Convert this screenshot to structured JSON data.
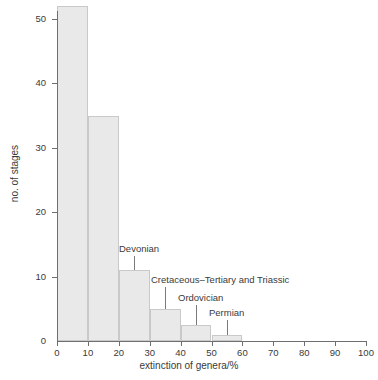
{
  "chart_data": {
    "type": "bar",
    "title": "",
    "subtitle": "",
    "xlabel": "extinction of genera/%",
    "ylabel": "no. of stages",
    "xlim": [
      0,
      100
    ],
    "ylim": [
      0,
      53
    ],
    "grid": false,
    "legend_position": "none",
    "bin_width": 10,
    "x_ticks": [
      0,
      10,
      20,
      30,
      40,
      50,
      60,
      70,
      80,
      90,
      100
    ],
    "x_tick_labels": [
      "0",
      "10",
      "20",
      "30",
      "40",
      "50",
      "60",
      "70",
      "80",
      "90",
      "100"
    ],
    "y_ticks": [
      0,
      10,
      20,
      30,
      40,
      50
    ],
    "y_tick_labels": [
      "0",
      "10",
      "20",
      "30",
      "40",
      "50"
    ],
    "categories": [
      "0-10",
      "10-20",
      "20-30",
      "30-40",
      "40-50",
      "50-60",
      "60-70",
      "70-80",
      "80-90",
      "90-100"
    ],
    "bin_edges": [
      0,
      10,
      20,
      30,
      40,
      50,
      60,
      70,
      80,
      90,
      100
    ],
    "values": [
      52,
      35,
      11,
      5,
      2.5,
      1,
      0,
      0,
      0,
      0
    ],
    "bar_fill_color": "#e9e9e9",
    "bar_edge_color": "#c9c9c9",
    "axis_color": "#6f6f6f",
    "text_color": "#3a3a3a",
    "annotations": [
      {
        "label": "Devonian",
        "x": 25,
        "y": 11
      },
      {
        "label": "Cretaceous–Tertiary and Triassic",
        "x": 35,
        "y": 5
      },
      {
        "label": "Ordovician",
        "x": 45,
        "y": 2.5
      },
      {
        "label": "Permian",
        "x": 55,
        "y": 1
      }
    ]
  }
}
